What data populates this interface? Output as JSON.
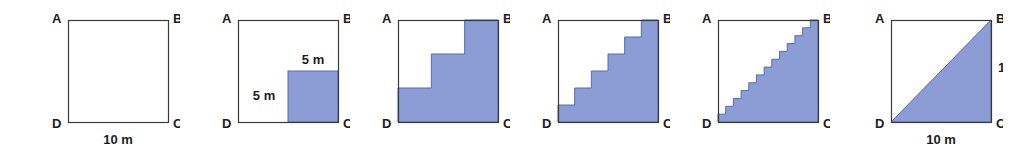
{
  "figure_strip": {
    "description": "Sequence of six squares ABCD showing staircase regions approximating the lower-right triangle",
    "colors": {
      "fill": "#8b9dd4",
      "fill_edge": "#5a6aa8",
      "stroke": "#3a3a3a",
      "background": "#ffffff",
      "text": "#1c1c1c"
    },
    "vertex_labels": {
      "top_left": "A",
      "top_right": "B",
      "bottom_right": "C",
      "bottom_left": "D"
    },
    "figures": [
      {
        "id": "figure-1-empty-square",
        "name": "empty-square",
        "steps": 0,
        "shaded": false,
        "labels": {
          "bottom": "10 m",
          "left": "",
          "right": "",
          "inner_vertical": "",
          "inner_horizontal": ""
        }
      },
      {
        "id": "figure-2-one-step",
        "name": "one-step-square",
        "steps": 1,
        "shaded": true,
        "labels": {
          "bottom": "",
          "left": "",
          "right": "",
          "inner_vertical": "5 m",
          "inner_horizontal": "5 m"
        }
      },
      {
        "id": "figure-3-three-steps",
        "name": "three-step-staircase",
        "steps": 3,
        "shaded": true,
        "labels": {
          "bottom": "",
          "left": "",
          "right": "",
          "inner_vertical": "",
          "inner_horizontal": ""
        }
      },
      {
        "id": "figure-4-six-steps",
        "name": "six-step-staircase",
        "steps": 6,
        "shaded": true,
        "labels": {
          "bottom": "",
          "left": "",
          "right": "",
          "inner_vertical": "",
          "inner_horizontal": ""
        }
      },
      {
        "id": "figure-5-thirteen-steps",
        "name": "thirteen-step-staircase",
        "steps": 13,
        "shaded": true,
        "labels": {
          "bottom": "",
          "left": "",
          "right": "",
          "inner_vertical": "",
          "inner_horizontal": ""
        }
      },
      {
        "id": "figure-6-triangle",
        "name": "diagonal-triangle",
        "steps": 0,
        "shaded": true,
        "diagonal": true,
        "labels": {
          "bottom": "10 m",
          "left": "",
          "right": "10 m",
          "inner_vertical": "",
          "inner_horizontal": ""
        }
      }
    ]
  }
}
